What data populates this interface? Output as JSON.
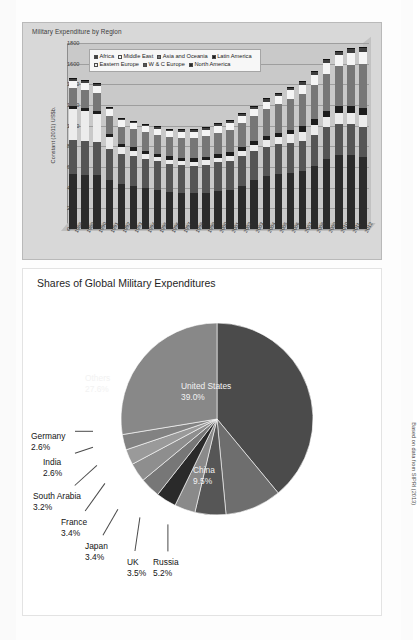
{
  "page": {
    "credit": "Based on data from SIPRI (2013)"
  },
  "bar_chart": {
    "title": "Military Expenditure by Region",
    "legend_rows": [
      [
        {
          "label": "Africa",
          "key": "af"
        },
        {
          "label": "Middle East",
          "key": "me"
        },
        {
          "label": "Asia and Oceania",
          "key": "ao"
        },
        {
          "label": "Latin America",
          "key": "la"
        }
      ],
      [
        {
          "label": "Eastern Europe",
          "key": "ee"
        },
        {
          "label": "W & C Europe",
          "key": "wce"
        },
        {
          "label": "North America",
          "key": "na"
        }
      ]
    ]
  },
  "chart_data": [
    {
      "type": "bar",
      "title": "Military Expenditure by Region",
      "xlabel": "Year",
      "ylabel": "Constant (2011) US$b.",
      "ylim": [
        0,
        1800
      ],
      "yticks": [
        0,
        200,
        400,
        600,
        800,
        1000,
        1200,
        1400,
        1600,
        1800
      ],
      "grid": true,
      "stacked": true,
      "legend_position": "top-inside",
      "categories": [
        "1988",
        "1989",
        "1990",
        "1991",
        "1992",
        "1993",
        "1994",
        "1995",
        "1996",
        "1997",
        "1998",
        "1999",
        "2000",
        "2001",
        "2002",
        "2003",
        "2004",
        "2005",
        "2006",
        "2007",
        "2008",
        "2009",
        "2010",
        "2011",
        "2012"
      ],
      "series": [
        {
          "name": "North America",
          "key": "na",
          "values": [
            530,
            520,
            520,
            470,
            440,
            420,
            400,
            380,
            360,
            350,
            345,
            350,
            370,
            380,
            420,
            470,
            510,
            530,
            545,
            560,
            610,
            680,
            720,
            720,
            700
          ]
        },
        {
          "name": "W & C Europe",
          "key": "wce",
          "values": [
            330,
            330,
            320,
            300,
            290,
            285,
            280,
            275,
            270,
            268,
            268,
            272,
            275,
            278,
            282,
            285,
            288,
            290,
            292,
            295,
            300,
            305,
            300,
            292,
            288
          ]
        },
        {
          "name": "Eastern Europe",
          "key": "ee",
          "values": [
            300,
            290,
            270,
            120,
            60,
            55,
            50,
            45,
            42,
            40,
            40,
            42,
            45,
            50,
            55,
            60,
            66,
            72,
            80,
            88,
            96,
            100,
            106,
            112,
            120
          ]
        },
        {
          "name": "Latin America",
          "key": "la",
          "values": [
            32,
            32,
            32,
            30,
            30,
            30,
            30,
            30,
            32,
            34,
            34,
            33,
            33,
            34,
            35,
            36,
            38,
            42,
            46,
            50,
            54,
            58,
            62,
            64,
            66
          ]
        },
        {
          "name": "Asia and Oceania",
          "key": "ao",
          "values": [
            170,
            172,
            175,
            172,
            172,
            175,
            178,
            182,
            186,
            192,
            196,
            200,
            208,
            218,
            230,
            242,
            256,
            272,
            292,
            312,
            334,
            362,
            386,
            404,
            420
          ]
        },
        {
          "name": "Middle East",
          "key": "me",
          "values": [
            70,
            70,
            68,
            66,
            62,
            60,
            58,
            56,
            56,
            58,
            60,
            62,
            64,
            68,
            70,
            72,
            76,
            80,
            86,
            92,
            98,
            104,
            110,
            116,
            122
          ]
        },
        {
          "name": "Africa",
          "key": "af",
          "values": [
            18,
            18,
            18,
            17,
            16,
            16,
            15,
            15,
            15,
            15,
            16,
            16,
            17,
            18,
            19,
            20,
            21,
            23,
            25,
            27,
            29,
            31,
            33,
            34,
            35
          ]
        }
      ]
    },
    {
      "type": "pie",
      "title": "Shares of Global Military Expenditures",
      "unit": "%",
      "slices": [
        {
          "label": "United States",
          "value": 39.0,
          "pct_text": "39.0%",
          "color": "#4b4b4b",
          "label_pos": "inside"
        },
        {
          "label": "China",
          "value": 9.5,
          "pct_text": "9.5%",
          "color": "#6e6e6e",
          "label_pos": "inside"
        },
        {
          "label": "Russia",
          "value": 5.2,
          "pct_text": "5.2%",
          "color": "#565656",
          "label_pos": "outside"
        },
        {
          "label": "UK",
          "value": 3.5,
          "pct_text": "3.5%",
          "color": "#8a8a8a",
          "label_pos": "outside"
        },
        {
          "label": "Japan",
          "value": 3.4,
          "pct_text": "3.4%",
          "color": "#2a2a2a",
          "label_pos": "outside"
        },
        {
          "label": "France",
          "value": 3.4,
          "pct_text": "3.4%",
          "color": "#777777",
          "label_pos": "outside"
        },
        {
          "label": "South Arabia",
          "value": 3.2,
          "pct_text": "3.2%",
          "color": "#8e8e8e",
          "label_pos": "outside"
        },
        {
          "label": "India",
          "value": 2.6,
          "pct_text": "2.6%",
          "color": "#9a9a9a",
          "label_pos": "outside"
        },
        {
          "label": "Germany",
          "value": 2.6,
          "pct_text": "2.6%",
          "color": "#828282",
          "label_pos": "outside"
        },
        {
          "label": "Others",
          "value": 27.6,
          "pct_text": "27.6%",
          "color": "#888888",
          "label_pos": "inside"
        }
      ]
    }
  ]
}
